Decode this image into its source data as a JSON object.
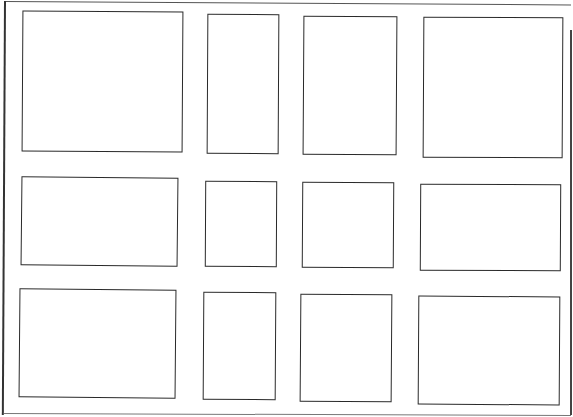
{
  "wireframe": {
    "description": "Hand-drawn wireframe: 4x3 grid of empty placeholder boxes inside an outer frame",
    "grid": {
      "columns": 4,
      "rows": 3
    },
    "stroke_color": "#2a2a2a",
    "background_color": "#ffffff",
    "cells": [
      {
        "row": 1,
        "col": 1,
        "label": ""
      },
      {
        "row": 1,
        "col": 2,
        "label": ""
      },
      {
        "row": 1,
        "col": 3,
        "label": ""
      },
      {
        "row": 1,
        "col": 4,
        "label": ""
      },
      {
        "row": 2,
        "col": 1,
        "label": ""
      },
      {
        "row": 2,
        "col": 2,
        "label": ""
      },
      {
        "row": 2,
        "col": 3,
        "label": ""
      },
      {
        "row": 2,
        "col": 4,
        "label": ""
      },
      {
        "row": 3,
        "col": 1,
        "label": ""
      },
      {
        "row": 3,
        "col": 2,
        "label": ""
      },
      {
        "row": 3,
        "col": 3,
        "label": ""
      },
      {
        "row": 3,
        "col": 4,
        "label": ""
      }
    ]
  }
}
